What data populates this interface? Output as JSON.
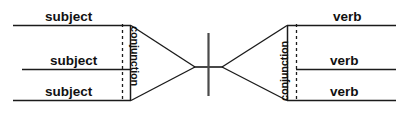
{
  "diagram": {
    "type": "sentence-diagram",
    "background_color": "#ffffff",
    "ink_color": "#1b1b1b",
    "divider_color": "#4a4a4a",
    "left_group": {
      "role": "compound-subject",
      "conjunction_label": "conjunction",
      "items": [
        {
          "label": "subject"
        },
        {
          "label": "subject"
        },
        {
          "label": "subject"
        }
      ]
    },
    "right_group": {
      "role": "compound-verb",
      "conjunction_label": "conjunction",
      "items": [
        {
          "label": "verb"
        },
        {
          "label": "verb"
        },
        {
          "label": "verb"
        }
      ]
    },
    "center": {
      "divider_name": "subject-verb-divider"
    }
  }
}
